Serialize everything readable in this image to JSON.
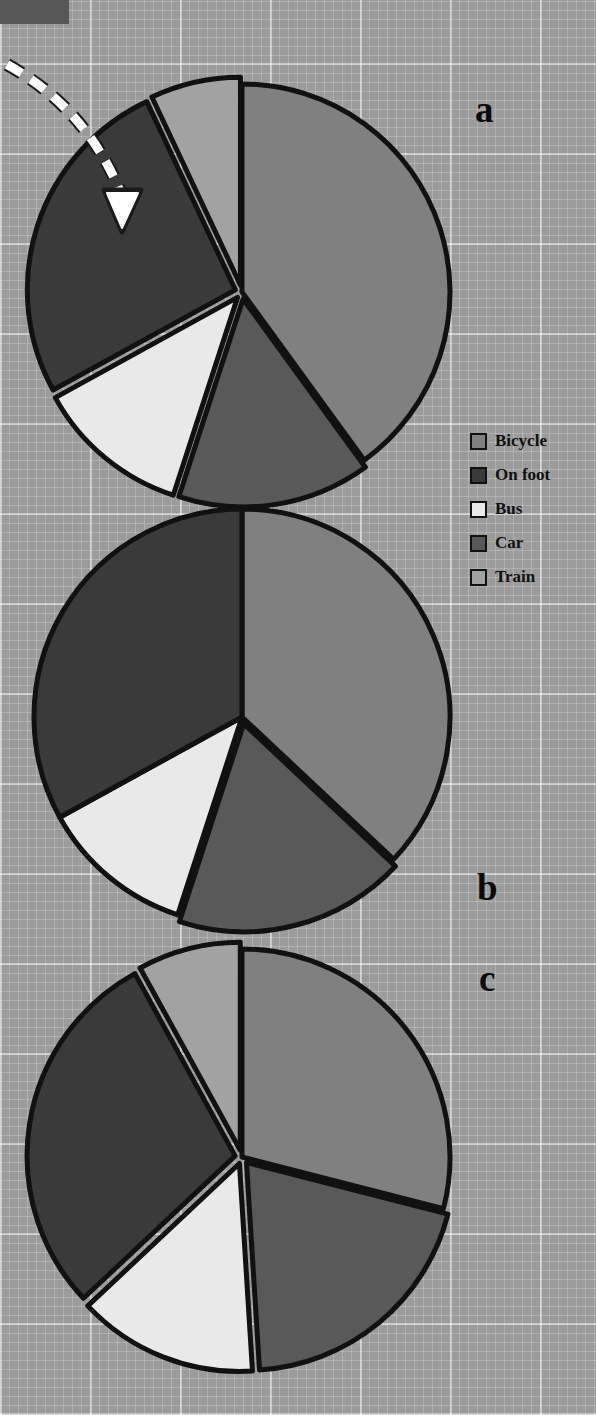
{
  "figure": {
    "background": "#9b9b9b",
    "corner_block_color": "#575757",
    "panel_labels": [
      {
        "name": "a",
        "text": "a"
      },
      {
        "name": "b",
        "text": "b"
      },
      {
        "name": "c",
        "text": "c"
      }
    ],
    "annotation": {
      "type": "curved-dashed-arrow",
      "color": "#ffffff",
      "points_to": "On foot"
    }
  },
  "legend": {
    "position": "right",
    "items": [
      {
        "label": "Bicycle",
        "color": "#808080"
      },
      {
        "label": "On foot",
        "color": "#3a3a3a"
      },
      {
        "label": "Bus",
        "color": "#e9e9e9"
      },
      {
        "label": "Car",
        "color": "#595959"
      },
      {
        "label": "Train",
        "color": "#a2a2a2"
      }
    ]
  },
  "chart_data": [
    {
      "type": "pie",
      "name": "a",
      "title": "a",
      "labels": [
        "Bicycle",
        "Car",
        "Bus",
        "On foot",
        "Train"
      ],
      "values": [
        40,
        15,
        12,
        26,
        7
      ],
      "colors": [
        "#808080",
        "#595959",
        "#e9e9e9",
        "#3a3a3a",
        "#a2a2a2"
      ],
      "exploded": [
        false,
        true,
        true,
        true,
        true
      ],
      "start_angle": 0,
      "direction": "clockwise",
      "legend": "right",
      "annotation": "dashed arrow points to On foot slice"
    },
    {
      "type": "pie",
      "name": "b",
      "title": "b",
      "labels": [
        "Bicycle",
        "Car",
        "Bus",
        "On foot"
      ],
      "values": [
        37,
        18,
        12,
        33
      ],
      "colors": [
        "#808080",
        "#595959",
        "#e9e9e9",
        "#3a3a3a"
      ],
      "exploded": [
        false,
        true,
        false,
        false
      ],
      "start_angle": 0,
      "direction": "clockwise",
      "legend": "right"
    },
    {
      "type": "pie",
      "name": "c",
      "title": "c",
      "labels": [
        "Bicycle",
        "Car",
        "Bus",
        "On foot",
        "Train"
      ],
      "values": [
        29,
        20,
        14,
        29,
        8
      ],
      "colors": [
        "#808080",
        "#595959",
        "#e9e9e9",
        "#3a3a3a",
        "#a2a2a2"
      ],
      "exploded": [
        false,
        true,
        true,
        true,
        true
      ],
      "start_angle": 0,
      "direction": "clockwise",
      "legend": "right"
    }
  ]
}
